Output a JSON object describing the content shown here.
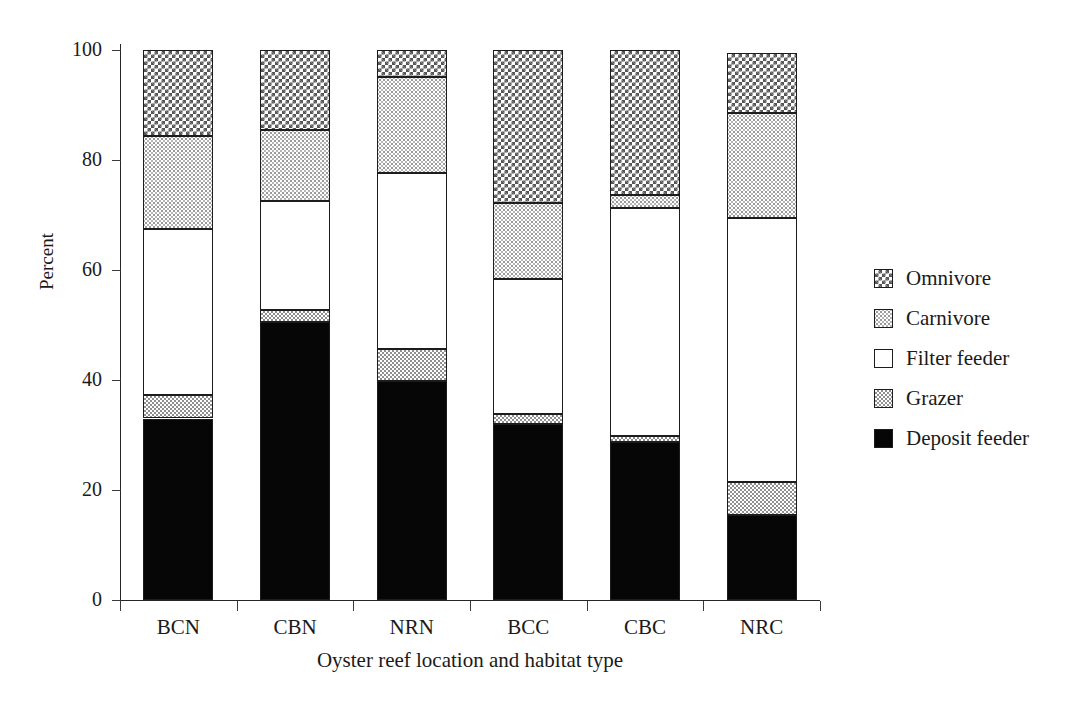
{
  "chart_data": {
    "type": "bar",
    "subtype": "stacked-bar-100-percent",
    "title": "",
    "xlabel": "Oyster reef location and habitat type",
    "ylabel": "Percent",
    "categories": [
      "BCN",
      "CBN",
      "NRN",
      "BCC",
      "CBC",
      "NRC"
    ],
    "ylim": [
      0,
      100
    ],
    "yticks": [
      0,
      20,
      40,
      60,
      80,
      100
    ],
    "ytick_labels": [
      "0",
      "20",
      "40",
      "60",
      "80",
      "100"
    ],
    "grid": false,
    "legend_position": "right",
    "stack_order_bottom_to_top": [
      "Deposit feeder",
      "Grazer",
      "Filter feeder",
      "Carnivore",
      "Omnivore"
    ],
    "series": [
      {
        "name": "Deposit feeder",
        "pattern": "solid-black",
        "color": "#060606",
        "values": [
          33.0,
          50.5,
          39.8,
          32.0,
          28.8,
          15.5
        ]
      },
      {
        "name": "Grazer",
        "pattern": "medium-gray-checker",
        "color": "#909090",
        "values": [
          4.2,
          2.2,
          5.8,
          1.8,
          1.0,
          6.0
        ]
      },
      {
        "name": "Filter feeder",
        "pattern": "white",
        "color": "#ffffff",
        "values": [
          30.2,
          19.8,
          32.0,
          24.5,
          41.4,
          48.0
        ]
      },
      {
        "name": "Carnivore",
        "pattern": "light-stipple",
        "color": "#b5b5b5",
        "values": [
          17.0,
          13.0,
          17.5,
          13.8,
          2.4,
          19.0
        ]
      },
      {
        "name": "Omnivore",
        "pattern": "dark-checker",
        "color": "#555555",
        "values": [
          15.6,
          14.5,
          4.9,
          27.9,
          26.4,
          11.0
        ]
      }
    ],
    "cumulative_tops": {
      "BCN": {
        "Deposit feeder": 33.0,
        "Grazer": 37.2,
        "Filter feeder": 67.4,
        "Carnivore": 84.4,
        "Omnivore": 100.0
      },
      "CBN": {
        "Deposit feeder": 50.5,
        "Grazer": 52.7,
        "Filter feeder": 72.5,
        "Carnivore": 85.5,
        "Omnivore": 100.0
      },
      "NRN": {
        "Deposit feeder": 39.8,
        "Grazer": 45.6,
        "Filter feeder": 77.6,
        "Carnivore": 95.1,
        "Omnivore": 100.0
      },
      "BCC": {
        "Deposit feeder": 32.0,
        "Grazer": 33.8,
        "Filter feeder": 58.3,
        "Carnivore": 72.1,
        "Omnivore": 100.0
      },
      "CBC": {
        "Deposit feeder": 28.8,
        "Grazer": 29.8,
        "Filter feeder": 71.2,
        "Carnivore": 73.6,
        "Omnivore": 100.0
      },
      "NRC": {
        "Deposit feeder": 15.5,
        "Grazer": 21.5,
        "Filter feeder": 69.5,
        "Carnivore": 88.5,
        "Omnivore": 99.5
      }
    }
  },
  "axes": {
    "y_title": "Percent",
    "x_title": "Oyster reef location and habitat type",
    "y_tick_labels": [
      "100",
      "80",
      "60",
      "40",
      "20",
      "0"
    ],
    "x_tick_labels": [
      "BCN",
      "CBN",
      "NRN",
      "BCC",
      "CBC",
      "NRC"
    ]
  },
  "legend": {
    "items": [
      {
        "label": "Omnivore",
        "pattern": "dark-checker"
      },
      {
        "label": "Carnivore",
        "pattern": "light-stipple"
      },
      {
        "label": "Filter feeder",
        "pattern": "white"
      },
      {
        "label": "Grazer",
        "pattern": "medium-gray-checker"
      },
      {
        "label": "Deposit feeder",
        "pattern": "solid-black"
      }
    ]
  }
}
